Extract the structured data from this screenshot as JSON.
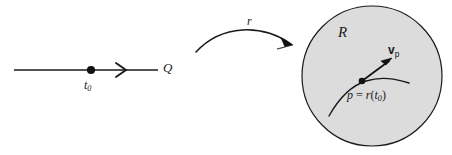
{
  "figure": {
    "background_color": "#ffffff",
    "stroke_color": "#1a1a1a",
    "region_fill_color": "#dcdcdc"
  },
  "domain_line": {
    "axis_label": "Q",
    "point_label": "t",
    "point_subscript": "0",
    "arrow_icon": "chevron-right-arrowhead",
    "point_icon": "filled-dot"
  },
  "map_arrow": {
    "label": "r",
    "icon": "curved-arrow-right"
  },
  "region": {
    "label": "R",
    "shape_icon": "filled-circle",
    "curve_icon": "curve-path",
    "point_icon": "filled-dot",
    "vector": {
      "symbol": "v",
      "subscript": "p",
      "icon": "vector-arrow"
    },
    "point_equation": {
      "point": "p",
      "equals": "=",
      "map": "r",
      "open_paren": "(",
      "parameter": "t",
      "parameter_subscript": "0",
      "close_paren": ")"
    }
  }
}
